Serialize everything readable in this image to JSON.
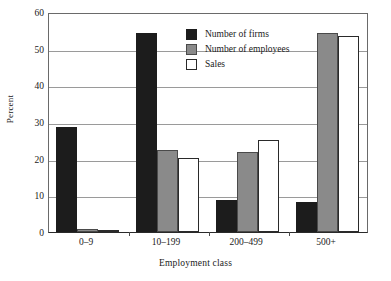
{
  "chart_data": {
    "type": "bar",
    "title": "",
    "subtitle": "",
    "xlabel": "Employment class",
    "ylabel": "Percent",
    "categories": [
      "0–9",
      "10–199",
      "200–499",
      "500+"
    ],
    "series": [
      {
        "name": "Number of firms",
        "values": [
          28.6,
          54.3,
          8.8,
          8.1
        ],
        "color": "#1c1c1c"
      },
      {
        "name": "Number of employees",
        "values": [
          0.9,
          22.4,
          21.9,
          54.4
        ],
        "color": "#8a8a8a"
      },
      {
        "name": "Sales",
        "values": [
          0.5,
          20.2,
          25.1,
          53.5
        ],
        "color": "#ffffff"
      }
    ],
    "ylim": [
      0,
      60
    ],
    "yticks": [
      0,
      10,
      20,
      30,
      40,
      50,
      60
    ],
    "ytick_labels": [
      "0",
      "10",
      "20",
      "30",
      "40",
      "50",
      "60"
    ],
    "grid": true,
    "grid_axis": "y",
    "legend_position": "top-center",
    "legend_entries": [
      "Number of firms",
      "Number of employees",
      "Sales"
    ],
    "colors": {
      "firms": "#1c1c1c",
      "employees": "#8a8a8a",
      "sales": "#ffffff",
      "axis": "#2a2a2a",
      "gridline": "#9a9a9a",
      "background": "#ffffff"
    }
  }
}
